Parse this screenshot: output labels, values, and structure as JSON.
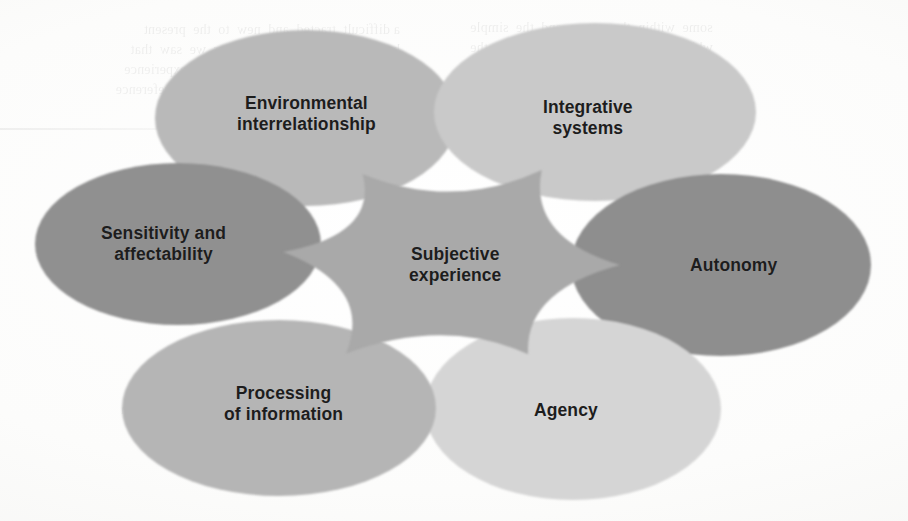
{
  "diagram": {
    "title": "Subjective experience",
    "type": "overlapping-ellipse-venn",
    "background_color": "#fcfcfb",
    "text_color": "#1d1d1d",
    "center": {
      "label": "Subjective\nexperience",
      "x": 455,
      "y": 265,
      "overlap_color": "#a9a9a9"
    },
    "petals": [
      {
        "id": "environmental-interrelationship",
        "label": "Environmental\ninterrelationship",
        "color": "#b9b9b9",
        "cx": 306,
        "cy": 118,
        "rx": 151,
        "ry": 88,
        "label_x": 306,
        "label_y": 114
      },
      {
        "id": "integrative-systems",
        "label": "Integrative\nsystems",
        "color": "#c9c9c9",
        "cx": 595,
        "cy": 112,
        "rx": 161,
        "ry": 89,
        "label_x": 588,
        "label_y": 118
      },
      {
        "id": "autonomy",
        "label": "Autonomy",
        "color": "#8e8e8e",
        "cx": 721,
        "cy": 265,
        "rx": 150,
        "ry": 91,
        "label_x": 733,
        "label_y": 265
      },
      {
        "id": "agency",
        "label": "Agency",
        "color": "#d5d5d5",
        "cx": 573,
        "cy": 409,
        "rx": 148,
        "ry": 91,
        "label_x": 566,
        "label_y": 410
      },
      {
        "id": "processing-of-information",
        "label": "Processing\nof information",
        "color": "#b5b5b5",
        "cx": 279,
        "cy": 408,
        "rx": 157,
        "ry": 88,
        "label_x": 283,
        "label_y": 404
      },
      {
        "id": "sensitivity-and-affectability",
        "label": "Sensitivity and\naffectability",
        "color": "#909090",
        "cx": 178,
        "cy": 244,
        "rx": 143,
        "ry": 81,
        "label_x": 163,
        "label_y": 244
      }
    ]
  },
  "bleed_through": {
    "top_left": "a difficult  tracted  and  new  to  the  present\nhypotheses.  In the  last  chapter  we  saw  that\ncontrolled  by  the  central  and  the  experience\nof the organism  the  relevant  and  the  reference",
    "top_right": "some  within  the  nature  and  the  simple\nwhich  a  structure  the  subjective  or  the\ncorrelation  of  the  and  the  consciousness",
    "bottom_left": "two  experiences  the  presence\nbe  could  and  the  relation  of  the\ninformation  the  is  a  the  temporal\nconstituent  the  present  an  the  and  certain\nprocesses  a  and  the  of  the",
    "bottom_right": "of  the  and  the  same\nthe  relation  the  is\nthat  of  the  and  to\nthe  and  the  consciousness"
  }
}
